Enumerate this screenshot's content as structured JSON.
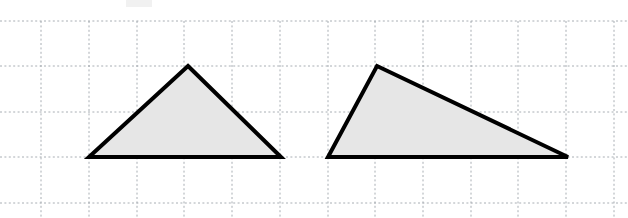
{
  "figure": {
    "background_color": "#ffffff",
    "grid": {
      "label": "dotted-graph-paper",
      "line_color": "#9aa0a6",
      "dash_pattern": "2 2.4",
      "vertical_positions": [
        41,
        89,
        137,
        184,
        232,
        280,
        328,
        375,
        423,
        471,
        518,
        566,
        614
      ],
      "horizontal_positions": [
        21,
        66,
        112,
        157,
        203
      ],
      "cell_width": 47.7,
      "cell_height": 45.5
    },
    "smudge": {
      "label": "paper-smudge",
      "x": 126,
      "y": 0,
      "width": 26,
      "height": 7
    },
    "shapes": [
      {
        "id": "triangle-left",
        "name": "left-triangle",
        "kind": "triangle",
        "classification": "acute isosceles-like",
        "fill_color": "#e6e6e6",
        "stroke_color": "#000000",
        "stroke_width": 4,
        "points": "188,66 281,157 89,157",
        "vertices": [
          {
            "label": "apex",
            "x": 188,
            "y": 66
          },
          {
            "label": "base-right",
            "x": 281,
            "y": 157
          },
          {
            "label": "base-left",
            "x": 89,
            "y": 157
          }
        ],
        "base_length_px": 192,
        "height_px": 91
      },
      {
        "id": "triangle-right",
        "name": "right-triangle",
        "kind": "triangle",
        "classification": "obtuse scalene",
        "fill_color": "#e6e6e6",
        "stroke_color": "#000000",
        "stroke_width": 4,
        "points": "377,66 568,157 328,157",
        "vertices": [
          {
            "label": "apex",
            "x": 377,
            "y": 66
          },
          {
            "label": "base-right",
            "x": 568,
            "y": 157
          },
          {
            "label": "base-left",
            "x": 328,
            "y": 157
          }
        ],
        "base_length_px": 240,
        "height_px": 91
      }
    ]
  }
}
